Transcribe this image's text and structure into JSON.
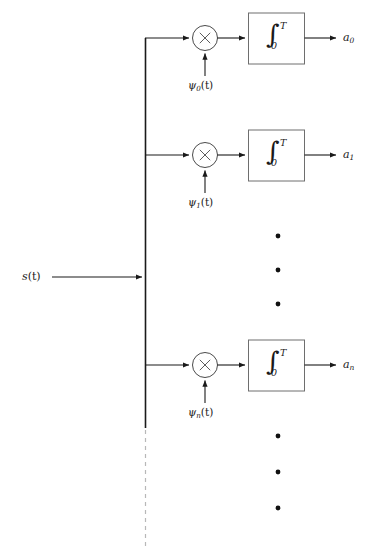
{
  "diagram": {
    "type": "signal-flow",
    "input": {
      "label_main": "s",
      "label_arg": "(t)",
      "name": "input-signal"
    },
    "integrator": {
      "glyph": "∫",
      "upper_limit": "T",
      "lower_limit": "0"
    },
    "multiplier": {
      "glyph": "×"
    },
    "branches": [
      {
        "basis_main": "ψ",
        "basis_sub": "0",
        "basis_arg": "(t)",
        "output_main": "a",
        "output_sub": "0"
      },
      {
        "basis_main": "ψ",
        "basis_sub": "1",
        "basis_arg": "(t)",
        "output_main": "a",
        "output_sub": "1"
      },
      {
        "basis_main": "ψ",
        "basis_sub": "n",
        "basis_arg": "(t)",
        "output_main": "a",
        "output_sub": "n"
      }
    ],
    "ellipsis_groups": [
      {
        "name": "ellipsis-middle",
        "count": 3
      },
      {
        "name": "ellipsis-bottom",
        "count": 3
      }
    ],
    "colors": {
      "line": "#1a1a1a",
      "circle_stroke": "#4a4a4a",
      "box_stroke": "#6e6e6e",
      "dashed_bus": "#b8b8b8",
      "dot": "#111111",
      "background": "#ffffff"
    }
  }
}
